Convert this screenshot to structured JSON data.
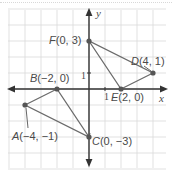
{
  "diagram": {
    "type": "coordinate-plane",
    "origin_px": [
      89,
      89
    ],
    "unit_px": 16,
    "grid": {
      "x_range": [
        -5,
        5
      ],
      "y_range": [
        -5,
        5
      ],
      "color": "#d9d9d9"
    },
    "axes": {
      "x_label": "x",
      "y_label": "y",
      "color": "#333333"
    },
    "ticks": {
      "x_unit_label": "1",
      "y_unit_label": "1"
    },
    "line_color": "#6b6b6b",
    "point_color": "#555555",
    "points": [
      {
        "name": "A",
        "coords": "(−4, −1)",
        "x": -4,
        "y": -1
      },
      {
        "name": "B",
        "coords": "(−2, 0)",
        "x": -2,
        "y": 0
      },
      {
        "name": "C",
        "coords": "(0, −3)",
        "x": 0,
        "y": -3
      },
      {
        "name": "D",
        "coords": "(4, 1)",
        "x": 4,
        "y": 1
      },
      {
        "name": "E",
        "coords": "(2, 0)",
        "x": 2,
        "y": 0
      },
      {
        "name": "F",
        "coords": "(0, 3)",
        "x": 0,
        "y": 3
      }
    ],
    "triangles": [
      {
        "name": "ABC",
        "vertices": [
          "A",
          "B",
          "C"
        ]
      },
      {
        "name": "DEF",
        "vertices": [
          "D",
          "E",
          "F"
        ]
      }
    ]
  }
}
